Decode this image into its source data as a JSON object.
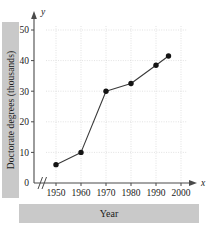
{
  "chart_data": {
    "type": "line",
    "title": "",
    "xlabel": "Year",
    "ylabel": "Doctorate degrees (thousands)",
    "x_axis_variable": "x",
    "y_axis_variable": "y",
    "xlim": [
      1945,
      2002
    ],
    "ylim": [
      0,
      55
    ],
    "x_ticks": [
      1950,
      1960,
      1970,
      1980,
      1990,
      2000
    ],
    "x_tick_labels": [
      "1950",
      "1960",
      "1970",
      "1980",
      "1990",
      "2000"
    ],
    "y_ticks": [
      0,
      10,
      20,
      30,
      40,
      50
    ],
    "y_tick_labels": [
      "0",
      "10",
      "20",
      "30",
      "40",
      "50"
    ],
    "grid": true,
    "grid_style": "dotted",
    "legend": "none",
    "axis_break": "//",
    "axis_break_note": "x-axis break between origin and 1950",
    "marker": "filled-circle",
    "x": [
      1950,
      1960,
      1970,
      1980,
      1990,
      1995
    ],
    "values": [
      6,
      10,
      30,
      32.5,
      38.5,
      41.5
    ],
    "series": [
      {
        "name": "Doctorate degrees",
        "points": [
          {
            "x": 1950,
            "y": 6
          },
          {
            "x": 1960,
            "y": 10
          },
          {
            "x": 1970,
            "y": 30
          },
          {
            "x": 1980,
            "y": 32.5
          },
          {
            "x": 1990,
            "y": 38.5
          },
          {
            "x": 1995,
            "y": 41.5
          }
        ]
      }
    ],
    "colors": {
      "line": "#3a3a3a",
      "marker": "#141414",
      "axis": "#4a4a4a",
      "grid": "#cfcfcf",
      "label_band": "#c9c9c9",
      "background": "#ffffff"
    }
  }
}
